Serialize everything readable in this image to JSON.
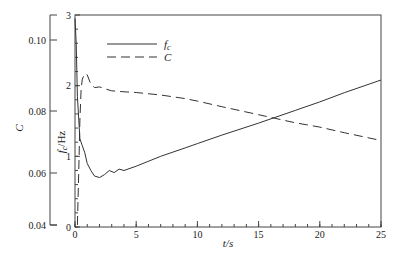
{
  "chart_data": {
    "type": "line",
    "title": "",
    "xlabel": "t/s",
    "xlim": [
      0,
      25
    ],
    "x_ticks": [
      "0",
      "5",
      "10",
      "15",
      "20",
      "25"
    ],
    "y_left": {
      "label": "C",
      "ylim": [
        0.04,
        0.108
      ],
      "ticks": [
        "0.04",
        "0.06",
        "0.08",
        "0.10"
      ]
    },
    "y_right": {
      "label": "fc/Hz",
      "label_main": "f",
      "label_sub": "c",
      "label_unit": "/Hz",
      "ylim": [
        0,
        3
      ],
      "ticks": [
        "0",
        "1",
        "2",
        "3"
      ]
    },
    "grid": false,
    "legend": {
      "position": "top-left",
      "entries": [
        {
          "name": "fc",
          "main": "f",
          "sub": "c",
          "style": "solid"
        },
        {
          "name": "C",
          "main": "C",
          "sub": "",
          "style": "dashed"
        }
      ]
    },
    "series": [
      {
        "name": "fc",
        "axis": "right",
        "style": "solid",
        "x": [
          0.0,
          0.1,
          0.2,
          0.4,
          0.6,
          0.8,
          1.0,
          1.3,
          1.6,
          2.0,
          2.4,
          2.8,
          3.2,
          3.6,
          4.0,
          5.0,
          7.0,
          9.0,
          10.0,
          12.0,
          15.0,
          18.0,
          20.0,
          22.0,
          25.0
        ],
        "y": [
          2.95,
          2.6,
          1.85,
          1.25,
          1.15,
          1.05,
          0.9,
          0.8,
          0.72,
          0.7,
          0.74,
          0.8,
          0.77,
          0.82,
          0.8,
          0.86,
          1.0,
          1.12,
          1.18,
          1.3,
          1.47,
          1.65,
          1.77,
          1.9,
          2.08
        ]
      },
      {
        "name": "C",
        "axis": "left",
        "style": "dashed",
        "x": [
          0.2,
          0.3,
          0.4,
          0.5,
          0.6,
          0.8,
          1.0,
          1.3,
          1.6,
          2.0,
          2.5,
          3.0,
          4.0,
          5.0,
          7.0,
          9.0,
          10.0,
          12.0,
          15.0,
          18.0,
          20.0,
          22.0,
          25.0
        ],
        "y": [
          0.04,
          0.06,
          0.077,
          0.086,
          0.089,
          0.0905,
          0.0902,
          0.0875,
          0.0866,
          0.0868,
          0.0862,
          0.0857,
          0.0854,
          0.0852,
          0.0845,
          0.0835,
          0.0828,
          0.0812,
          0.0788,
          0.0762,
          0.0748,
          0.073,
          0.0705
        ]
      }
    ]
  }
}
